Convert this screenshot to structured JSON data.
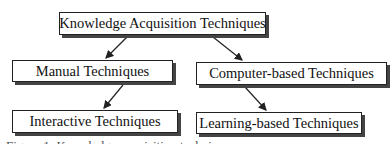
{
  "diagram": {
    "root": {
      "label": "Knowledge Acquisition Techniques"
    },
    "nodes": [
      {
        "id": "manual",
        "label": "Manual Techniques"
      },
      {
        "id": "computer",
        "label": "Computer-based Techniques"
      },
      {
        "id": "interactive",
        "label": "Interactive Techniques"
      },
      {
        "id": "learning",
        "label": "Learning-based Techniques"
      }
    ],
    "edges": [
      {
        "from": "root",
        "to": "manual"
      },
      {
        "from": "root",
        "to": "computer"
      },
      {
        "from": "manual",
        "to": "interactive"
      },
      {
        "from": "computer",
        "to": "learning"
      }
    ],
    "caption": "Figure 1: Knowledge acquisition techniques"
  }
}
